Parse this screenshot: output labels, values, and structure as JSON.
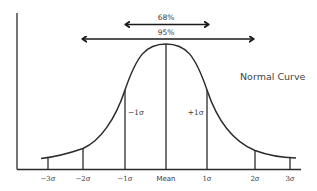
{
  "diagram": {
    "type": "normal-distribution-curve",
    "title": "Normal Curve",
    "arrows": [
      {
        "label": "68%",
        "from": "-1σ",
        "to": "+1σ"
      },
      {
        "label": "95%",
        "from": "-2σ",
        "to": "+2σ"
      }
    ],
    "x_ticks": [
      "−3σ",
      "−2σ",
      "−1σ",
      "Mean",
      "1σ",
      "2σ",
      "3σ"
    ],
    "inner_labels": {
      "minus_one_sigma": "−1σ",
      "plus_one_sigma": "+1σ"
    },
    "colors": {
      "line": "#2b2b2b",
      "text": "#3a3a3a",
      "background": "#ffffff"
    }
  }
}
